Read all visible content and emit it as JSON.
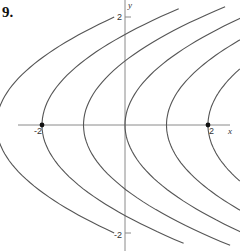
{
  "problem_number": "9.",
  "chart_data": {
    "type": "line",
    "title": "",
    "xlabel": "x",
    "ylabel": "y",
    "xlim": [
      -2.6,
      2.6
    ],
    "ylim": [
      -3.0,
      3.0
    ],
    "grid": false,
    "legend": null,
    "family": "x = a*y^2 + C (parabolas opening right)",
    "a": 0.42,
    "series": [
      {
        "name": "C=-3",
        "C": -3.1,
        "y_range": [
          -2.6,
          2.6
        ]
      },
      {
        "name": "C=-2",
        "C": -2,
        "y_range": [
          -2.85,
          2.8
        ]
      },
      {
        "name": "C=-1",
        "C": -1,
        "y_range": [
          -2.9,
          2.85
        ]
      },
      {
        "name": "C=0",
        "C": 0,
        "y_range": [
          -2.75,
          2.75
        ]
      },
      {
        "name": "C=1",
        "C": 1,
        "y_range": [
          -2.1,
          2.1
        ]
      },
      {
        "name": "C=2",
        "C": 2,
        "y_range": [
          -1.35,
          1.35
        ]
      }
    ],
    "marked_points": [
      {
        "x": -2,
        "y": 0
      },
      {
        "x": 2,
        "y": 0
      }
    ],
    "tick_labels": {
      "x": [
        {
          "value": -2,
          "label": "-2"
        },
        {
          "value": 2,
          "label": "2"
        }
      ],
      "y": [
        {
          "value": 2,
          "label": "2"
        },
        {
          "value": -2,
          "label": "-2"
        }
      ]
    }
  },
  "labels": {
    "x_axis": "x",
    "y_axis": "y",
    "x_neg2": "-2",
    "x_pos2": "2",
    "y_pos2": "2",
    "y_neg2": "-2"
  }
}
